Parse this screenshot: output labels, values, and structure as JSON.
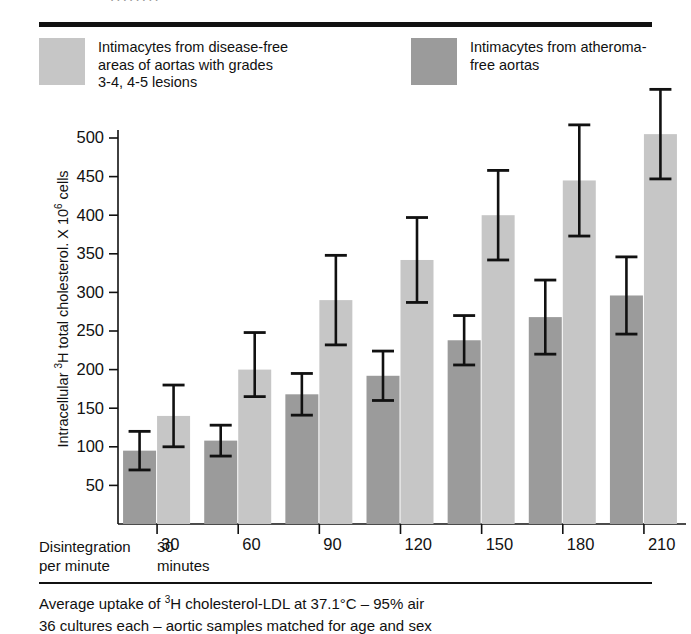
{
  "top_cutoff_text": "........",
  "legend": {
    "items": [
      {
        "key": "light",
        "color": "#c6c6c6",
        "label": "Intimacytes from disease-free\nareas of aortas with grades\n3-4, 4-5 lesions"
      },
      {
        "key": "dark",
        "color": "#9b9b9b",
        "label": "Intimacytes from atheroma-\nfree aortas"
      }
    ]
  },
  "axes": {
    "y_label_prefix": "Intracellular ",
    "y_label_sup1": "3",
    "y_label_mid": "H total cholesterol. X 10",
    "y_label_sup2": "6",
    "y_label_suffix": " cells",
    "y_ticks": [
      50,
      100,
      150,
      200,
      250,
      300,
      350,
      400,
      450,
      500
    ],
    "x_caption_left": "Disintegration\nper minute",
    "x_caption_unit": "30\nminutes"
  },
  "footnote": {
    "line1_a": "Average uptake of ",
    "line1_sup": "3",
    "line1_b": "H cholesterol-LDL at 37.1°C – 95% air",
    "line2": "36 cultures each – aortic samples matched for age and sex"
  },
  "chart_data": {
    "type": "bar",
    "title": "",
    "xlabel": "Disintegration per minute – minutes",
    "ylabel": "Intracellular 3H total cholesterol. X 10^6 cells",
    "ylim": [
      0,
      520
    ],
    "grid": false,
    "legend_position": "top",
    "categories": [
      "30",
      "60",
      "90",
      "120",
      "150",
      "180",
      "210"
    ],
    "series": [
      {
        "name": "Intimacytes from atheroma-free aortas",
        "key": "dark",
        "color": "#9b9b9b",
        "values": [
          95,
          108,
          168,
          192,
          238,
          268,
          296
        ],
        "errors_upper": [
          25,
          20,
          27,
          32,
          32,
          48,
          50
        ],
        "errors_lower": [
          25,
          20,
          27,
          32,
          32,
          48,
          50
        ]
      },
      {
        "name": "Intimacytes from disease-free areas of aortas with grades 3-4, 4-5 lesions",
        "key": "light",
        "color": "#c6c6c6",
        "values": [
          140,
          200,
          290,
          342,
          400,
          445,
          505
        ],
        "errors_upper": [
          40,
          48,
          58,
          55,
          58,
          72,
          58
        ],
        "errors_lower": [
          40,
          35,
          58,
          55,
          58,
          72,
          58
        ]
      }
    ]
  }
}
